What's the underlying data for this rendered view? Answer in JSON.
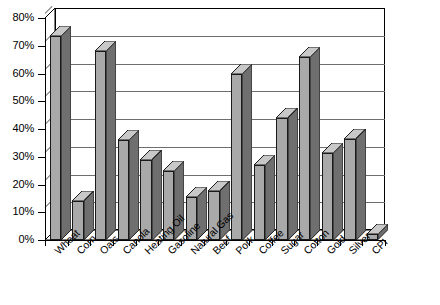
{
  "chart_data": {
    "type": "bar",
    "title": "",
    "xlabel": "",
    "ylabel": "",
    "ylim": [
      0,
      80
    ],
    "ytick_step": 10,
    "ytick_labels": [
      "0%",
      "10%",
      "20%",
      "30%",
      "40%",
      "50%",
      "60%",
      "70%",
      "80%"
    ],
    "grid": true,
    "legend": "none",
    "style_3d": true,
    "bar_color": "#a9a9a9",
    "bar_edge_color": "#1a1a1a",
    "categories": [
      "Wheat",
      "Corn",
      "Oats",
      "Canola",
      "Heating Oil",
      "Gasoline",
      "Natural Gas",
      "Beef",
      "Pork",
      "Coffee",
      "Sugar",
      "Cotton",
      "Gold",
      "Silver",
      "CPI"
    ],
    "values": [
      73.5,
      14,
      68,
      36,
      29,
      25,
      15.5,
      17.5,
      60,
      27,
      44,
      66,
      31.5,
      36.5,
      2
    ],
    "value_unit": "%"
  }
}
